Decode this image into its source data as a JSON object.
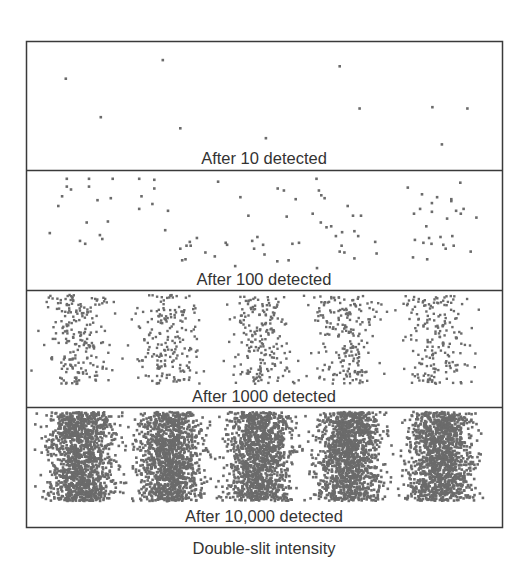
{
  "figure": {
    "caption": "Double-slit intensity",
    "dot_color": "#6b6b6b",
    "frame_color": "#3a3a3a",
    "fringe_count": 5,
    "panels": [
      {
        "label": "After 10 detected",
        "detected": 10,
        "points_note": "individual detections, normalized x in [0,1] across panel width, y in [0,1] across panel height",
        "points": [
          [
            0.08,
            0.28
          ],
          [
            0.285,
            0.13
          ],
          [
            0.154,
            0.59
          ],
          [
            0.322,
            0.68
          ],
          [
            0.503,
            0.76
          ],
          [
            0.659,
            0.18
          ],
          [
            0.701,
            0.52
          ],
          [
            0.855,
            0.51
          ],
          [
            0.929,
            0.52
          ],
          [
            0.875,
            0.81
          ]
        ]
      },
      {
        "label": "After 100 detected",
        "detected": 100,
        "points": [
          [
            0.082,
            0.06
          ],
          [
            0.129,
            0.06
          ],
          [
            0.082,
            0.14
          ],
          [
            0.091,
            0.17
          ],
          [
            0.129,
            0.14
          ],
          [
            0.072,
            0.24
          ],
          [
            0.064,
            0.34
          ],
          [
            0.147,
            0.28
          ],
          [
            0.124,
            0.51
          ],
          [
            0.175,
            0.26
          ],
          [
            0.046,
            0.62
          ],
          [
            0.169,
            0.5
          ],
          [
            0.11,
            0.7
          ],
          [
            0.157,
            0.68
          ],
          [
            0.121,
            0.73
          ],
          [
            0.152,
            0.64
          ],
          [
            0.179,
            0.06
          ],
          [
            0.267,
            0.07
          ],
          [
            0.235,
            0.06
          ],
          [
            0.267,
            0.16
          ],
          [
            0.24,
            0.24
          ],
          [
            0.235,
            0.37
          ],
          [
            0.263,
            0.32
          ],
          [
            0.296,
            0.39
          ],
          [
            0.29,
            0.59
          ],
          [
            0.322,
            0.78
          ],
          [
            0.335,
            0.75
          ],
          [
            0.342,
            0.71
          ],
          [
            0.357,
            0.67
          ],
          [
            0.344,
            0.75
          ],
          [
            0.326,
            0.9
          ],
          [
            0.333,
            0.89
          ],
          [
            0.375,
            0.82
          ],
          [
            0.395,
            0.86
          ],
          [
            0.402,
            0.09
          ],
          [
            0.418,
            0.72
          ],
          [
            0.421,
            0.74
          ],
          [
            0.438,
            0.96
          ],
          [
            0.449,
            0.25
          ],
          [
            0.466,
            0.44
          ],
          [
            0.485,
            0.66
          ],
          [
            0.497,
            0.74
          ],
          [
            0.474,
            0.7
          ],
          [
            0.5,
            0.84
          ],
          [
            0.478,
            0.78
          ],
          [
            0.528,
            0.16
          ],
          [
            0.541,
            0.18
          ],
          [
            0.547,
            0.45
          ],
          [
            0.566,
            0.27
          ],
          [
            0.527,
            0.91
          ],
          [
            0.573,
            0.72
          ],
          [
            0.551,
            0.9
          ],
          [
            0.559,
            0.73
          ],
          [
            0.61,
            0.06
          ],
          [
            0.615,
            0.18
          ],
          [
            0.62,
            0.23
          ],
          [
            0.627,
            0.26
          ],
          [
            0.602,
            0.42
          ],
          [
            0.619,
            0.51
          ],
          [
            0.631,
            0.56
          ],
          [
            0.651,
            0.65
          ],
          [
            0.663,
            0.75
          ],
          [
            0.641,
            0.55
          ],
          [
            0.664,
            0.61
          ],
          [
            0.676,
            0.34
          ],
          [
            0.687,
            0.44
          ],
          [
            0.69,
            0.6
          ],
          [
            0.698,
            0.65
          ],
          [
            0.704,
            0.44
          ],
          [
            0.659,
            0.81
          ],
          [
            0.669,
            0.82
          ],
          [
            0.611,
            0.98
          ],
          [
            0.737,
            0.83
          ],
          [
            0.734,
            0.71
          ],
          [
            0.69,
            0.88
          ],
          [
            0.803,
            0.15
          ],
          [
            0.833,
            0.22
          ],
          [
            0.829,
            0.37
          ],
          [
            0.854,
            0.31
          ],
          [
            0.816,
            0.42
          ],
          [
            0.854,
            0.4
          ],
          [
            0.865,
            0.25
          ],
          [
            0.895,
            0.27
          ],
          [
            0.905,
            0.39
          ],
          [
            0.886,
            0.47
          ],
          [
            0.842,
            0.55
          ],
          [
            0.848,
            0.67
          ],
          [
            0.853,
            0.73
          ],
          [
            0.836,
            0.72
          ],
          [
            0.818,
            0.69
          ],
          [
            0.872,
            0.66
          ],
          [
            0.878,
            0.74
          ],
          [
            0.915,
            0.42
          ],
          [
            0.921,
            0.37
          ],
          [
            0.897,
            0.65
          ],
          [
            0.883,
            0.78
          ],
          [
            0.844,
            0.89
          ],
          [
            0.814,
            0.87
          ],
          [
            0.936,
            0.81
          ],
          [
            0.895,
            0.29
          ],
          [
            0.948,
            0.46
          ],
          [
            0.914,
            0.1
          ],
          [
            0.9,
            0.75
          ]
        ]
      },
      {
        "label": "After 1000 detected",
        "detected": 1000,
        "generated": true,
        "seed": 1337
      },
      {
        "label": "After 10,000 detected",
        "detected": 10000,
        "generated": true,
        "seed": 4242
      }
    ]
  }
}
